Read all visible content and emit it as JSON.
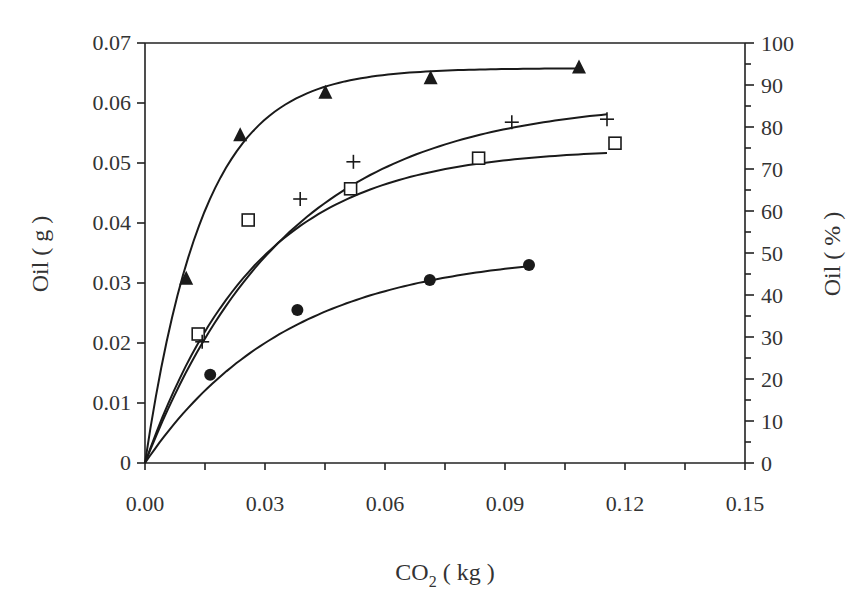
{
  "chart_data": {
    "type": "scatter",
    "title": "",
    "xlabel": "CO2 ( kg )",
    "xlabel_main": "CO",
    "xlabel_sub": "2",
    "xlabel_unit": " ( kg )",
    "ylabel": "Oil ( g )",
    "y2label": "Oil ( % )",
    "xlim": [
      0,
      0.15
    ],
    "ylim": [
      0,
      0.07
    ],
    "y2lim": [
      0,
      100
    ],
    "grid": false,
    "legend": "none",
    "x_ticks": [
      "0.00",
      "0.03",
      "0.06",
      "0.09",
      "0.12",
      "0.15"
    ],
    "y_ticks": [
      "0",
      "0.01",
      "0.02",
      "0.03",
      "0.04",
      "0.05",
      "0.06",
      "0.07"
    ],
    "y2_ticks": [
      "0",
      "10",
      "20",
      "30",
      "40",
      "50",
      "60",
      "70",
      "80",
      "90",
      "100"
    ],
    "series": [
      {
        "name": "filled-triangle",
        "marker": "triangle-filled",
        "x": [
          0.0103,
          0.0238,
          0.0451,
          0.0714,
          0.1085
        ],
        "y": [
          0.0308,
          0.0547,
          0.0618,
          0.0642,
          0.066
        ],
        "fit": {
          "type": "exponential-saturation",
          "ymax": 0.0658,
          "k": 68,
          "x_end": 0.108
        }
      },
      {
        "name": "open-square",
        "marker": "square-open",
        "x": [
          0.0133,
          0.0258,
          0.0514,
          0.0834,
          0.1175
        ],
        "y": [
          0.0215,
          0.0405,
          0.0457,
          0.0508,
          0.0533
        ],
        "fit": {
          "type": "exponential-saturation",
          "ymax": 0.0525,
          "k": 36,
          "x_end": 0.1155
        }
      },
      {
        "name": "plus",
        "marker": "plus",
        "x": [
          0.0143,
          0.0388,
          0.0521,
          0.0917,
          0.1155
        ],
        "y": [
          0.0202,
          0.044,
          0.0502,
          0.0568,
          0.0573
        ],
        "fit": {
          "type": "exponential-saturation",
          "ymax": 0.0605,
          "k": 28,
          "x_end": 0.1155
        }
      },
      {
        "name": "filled-circle",
        "marker": "circle-filled",
        "x": [
          0.0163,
          0.0381,
          0.0712,
          0.096
        ],
        "y": [
          0.0147,
          0.0255,
          0.0305,
          0.033
        ],
        "fit": {
          "type": "exponential-saturation",
          "ymax": 0.0352,
          "k": 28,
          "x_end": 0.096
        }
      }
    ]
  },
  "colors": {
    "ink": "#1a1a1a",
    "background": "#ffffff"
  }
}
